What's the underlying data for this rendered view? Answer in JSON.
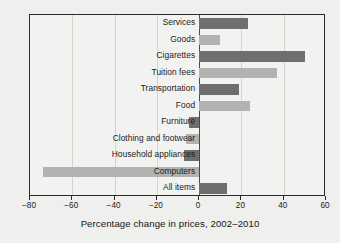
{
  "chart_data": {
    "type": "bar",
    "orientation": "horizontal",
    "title": "",
    "xlabel": "Percentage change in prices, 2002–2010",
    "ylabel": "",
    "xlim": [
      -80,
      60
    ],
    "xticks": [
      -80,
      -60,
      -40,
      -20,
      0,
      20,
      40,
      60
    ],
    "xtick_labels": [
      "−80",
      "−60",
      "−40",
      "−20",
      "0",
      "20",
      "40",
      "60"
    ],
    "grid": true,
    "legend": "none",
    "categories": [
      "Services",
      "Goods",
      "Cigarettes",
      "Tuition fees",
      "Transportation",
      "Food",
      "Furniture",
      "Clothing and footwear",
      "Household appliances",
      "Computers",
      "All items"
    ],
    "values": [
      23,
      10,
      50,
      37,
      19,
      24,
      -5,
      -6,
      -7,
      -74,
      13
    ],
    "bar_colors": [
      "#6e6e6e",
      "#b2b2b2",
      "#6e6e6e",
      "#b2b2b2",
      "#6e6e6e",
      "#b2b2b2",
      "#6e6e6e",
      "#b2b2b2",
      "#6e6e6e",
      "#b2b2b2",
      "#6e6e6e"
    ]
  },
  "figure": {
    "axis_title": "Percentage change in prices, 2002–2010",
    "frame_color": "#2a2a2a",
    "grid_color": "#d3d3cf",
    "background": "#efefed"
  }
}
